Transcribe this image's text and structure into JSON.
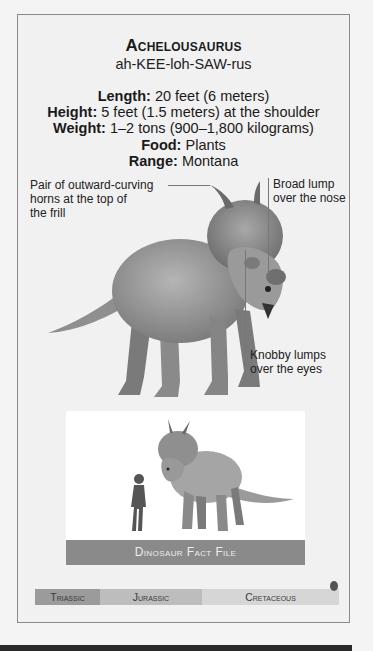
{
  "card": {
    "title": "Achelousaurus",
    "pronunciation": "ah-KEE-loh-SAW-rus",
    "facts": [
      {
        "label": "Length:",
        "value": "20 feet (6 meters)"
      },
      {
        "label": "Height:",
        "value": "5 feet (1.5 meters) at the shoulder"
      },
      {
        "label": "Weight:",
        "value": "1–2 tons (900–1,800 kilograms)"
      },
      {
        "label": "Food:",
        "value": "Plants"
      },
      {
        "label": "Range:",
        "value": "Montana"
      }
    ]
  },
  "callouts": {
    "horns": {
      "line1": "Pair of outward-curving",
      "line2": "horns at the top of",
      "line3": "the frill"
    },
    "nose": {
      "line1": "Broad lump",
      "line2": "over the nose"
    },
    "eyes": {
      "line1": "Knobby lumps",
      "line2": "over the eyes"
    }
  },
  "scale_inset": {
    "banner": "Dinosaur Fact File"
  },
  "timeline": {
    "periods": [
      "Triassic",
      "Jurassic",
      "Cretaceous"
    ],
    "marker_period": "Cretaceous",
    "colors": {
      "triassic": "#9b9b9b",
      "jurassic": "#bdbdbd",
      "cretaceous": "#d6d6d6",
      "marker": "#555555"
    }
  }
}
